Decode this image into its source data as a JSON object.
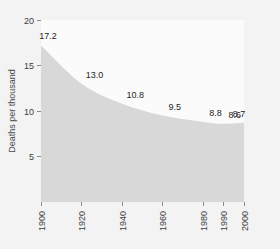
{
  "chart_data": {
    "type": "area",
    "title": "",
    "subtitle": "",
    "xlabel": "",
    "ylabel": "Deaths per thousand",
    "x": [
      1900,
      1920,
      1940,
      1960,
      1980,
      1990,
      2000
    ],
    "categories": [
      "1900",
      "1920",
      "1940",
      "1960",
      "1980",
      "1990",
      "2000"
    ],
    "values": [
      17.2,
      13.0,
      10.8,
      9.5,
      8.8,
      8.6,
      8.7
    ],
    "point_labels": [
      "17.2",
      "13.0",
      "10.8",
      "9.5",
      "8.8",
      "8.6",
      "8.7"
    ],
    "xlim": [
      1900,
      2000
    ],
    "ylim": [
      0,
      20
    ],
    "ytick_labels": [
      "5",
      "10",
      "15",
      "20"
    ],
    "ytick_values": [
      5,
      10,
      15,
      20
    ],
    "xtick_labels": [
      "1900",
      "1920",
      "1940",
      "1960",
      "1980",
      "1990",
      "2000"
    ],
    "xtick_values": [
      1900,
      1920,
      1940,
      1960,
      1980,
      1990,
      2000
    ],
    "grid": false,
    "legend": false,
    "legend_position": "none",
    "series": [
      {
        "name": "Deaths per thousand",
        "values": [
          17.2,
          13.0,
          10.8,
          9.5,
          8.8,
          8.6,
          8.7
        ]
      }
    ],
    "colors": {
      "area_fill": "#d8d8d8",
      "plot_background": "#fbfbfb",
      "figure_background": "#f3f3f3",
      "tick_color": "#8a8a8a",
      "text_color": "#3c3c3c",
      "label_color": "#1d1d1d"
    }
  }
}
